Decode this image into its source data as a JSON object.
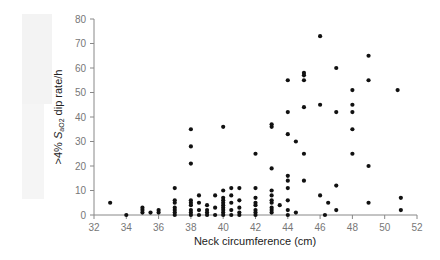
{
  "chart_data": {
    "type": "scatter",
    "title": "",
    "xlabel": "Neck circumference (cm)",
    "ylabel": ">4% SaO2 dip rate/h",
    "ylabel_parts": {
      "prefix": ">4% ",
      "s": "S",
      "sub": "aO2",
      "suffix": " dip rate/h"
    },
    "xlim": [
      32,
      52
    ],
    "ylim": [
      0,
      80
    ],
    "xticks": [
      32,
      34,
      36,
      38,
      40,
      42,
      44,
      46,
      48,
      50,
      52
    ],
    "yticks": [
      0,
      10,
      20,
      30,
      40,
      50,
      60,
      70,
      80
    ],
    "grid": false,
    "legend": null,
    "point_color": "#111111",
    "points": [
      [
        33,
        5
      ],
      [
        34,
        0
      ],
      [
        35,
        1
      ],
      [
        35,
        2
      ],
      [
        35,
        3
      ],
      [
        35.5,
        1
      ],
      [
        36,
        1
      ],
      [
        36,
        2
      ],
      [
        37,
        0
      ],
      [
        37,
        1
      ],
      [
        37,
        2
      ],
      [
        37,
        3
      ],
      [
        37,
        5
      ],
      [
        37,
        6
      ],
      [
        37,
        11
      ],
      [
        38,
        0
      ],
      [
        38,
        1
      ],
      [
        38,
        2
      ],
      [
        38,
        4
      ],
      [
        38,
        5
      ],
      [
        38,
        6
      ],
      [
        38,
        21
      ],
      [
        38,
        28
      ],
      [
        38,
        35
      ],
      [
        38.5,
        0
      ],
      [
        38.5,
        2
      ],
      [
        38.5,
        5
      ],
      [
        38.5,
        8
      ],
      [
        39,
        0
      ],
      [
        39,
        1
      ],
      [
        39,
        2
      ],
      [
        39,
        4
      ],
      [
        39.5,
        0
      ],
      [
        39.5,
        3
      ],
      [
        39.5,
        8
      ],
      [
        40,
        0
      ],
      [
        40,
        1
      ],
      [
        40,
        2
      ],
      [
        40,
        3
      ],
      [
        40,
        4
      ],
      [
        40,
        5
      ],
      [
        40,
        6
      ],
      [
        40,
        7
      ],
      [
        40,
        10
      ],
      [
        40,
        36
      ],
      [
        40.5,
        0
      ],
      [
        40.5,
        2
      ],
      [
        40.5,
        5
      ],
      [
        40.5,
        8
      ],
      [
        40.5,
        11
      ],
      [
        41,
        0
      ],
      [
        41,
        1
      ],
      [
        41,
        3
      ],
      [
        41,
        6
      ],
      [
        41,
        11
      ],
      [
        42,
        0
      ],
      [
        42,
        1
      ],
      [
        42,
        2
      ],
      [
        42,
        4
      ],
      [
        42,
        5
      ],
      [
        42,
        7
      ],
      [
        42,
        11
      ],
      [
        42,
        25
      ],
      [
        43,
        1
      ],
      [
        43,
        2
      ],
      [
        43,
        3
      ],
      [
        43,
        5
      ],
      [
        43,
        6
      ],
      [
        43,
        8
      ],
      [
        43,
        10
      ],
      [
        43,
        19
      ],
      [
        43,
        36
      ],
      [
        43,
        37
      ],
      [
        43.5,
        4
      ],
      [
        44,
        0
      ],
      [
        44,
        2
      ],
      [
        44,
        6
      ],
      [
        44,
        11
      ],
      [
        44,
        14
      ],
      [
        44,
        16
      ],
      [
        44,
        33
      ],
      [
        44,
        42
      ],
      [
        44,
        55
      ],
      [
        44.5,
        1
      ],
      [
        44.5,
        30
      ],
      [
        45,
        14
      ],
      [
        45,
        25
      ],
      [
        45,
        44
      ],
      [
        45,
        55
      ],
      [
        45,
        57
      ],
      [
        45,
        58
      ],
      [
        46,
        8
      ],
      [
        46,
        45
      ],
      [
        46,
        73
      ],
      [
        46.3,
        0
      ],
      [
        46.5,
        5
      ],
      [
        47,
        2
      ],
      [
        47,
        12
      ],
      [
        47,
        42
      ],
      [
        47,
        60
      ],
      [
        48,
        25
      ],
      [
        48,
        35
      ],
      [
        48,
        42
      ],
      [
        48,
        45
      ],
      [
        48,
        51
      ],
      [
        49,
        5
      ],
      [
        49,
        20
      ],
      [
        49,
        55
      ],
      [
        49,
        65
      ],
      [
        50.8,
        51
      ],
      [
        51,
        2
      ],
      [
        51,
        7
      ]
    ]
  }
}
